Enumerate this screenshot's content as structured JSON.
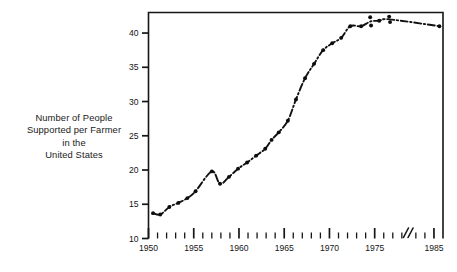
{
  "figure": {
    "axis_caption_lines": [
      "Number of People",
      "Supported per Farmer",
      "in the",
      "United States"
    ]
  },
  "chart_data": {
    "type": "line",
    "title": "",
    "subtitle": "",
    "xlabel": "",
    "ylabel": "Number of People Supported per Farmer in the United States",
    "xlim": [
      1950,
      1986
    ],
    "ylim": [
      10,
      43
    ],
    "grid": false,
    "legend": null,
    "axis_break": {
      "present": true,
      "between": [
        1978,
        1983
      ],
      "symbol": "double-slash"
    },
    "x_tick_labels": [
      "1950",
      "1955",
      "1960",
      "1965",
      "1970",
      "1975",
      "1985"
    ],
    "x_major_ticks": [
      1950,
      1955,
      1960,
      1965,
      1970,
      1975,
      1985
    ],
    "x_minor_tick_interval": 1,
    "y_tick_labels": [
      "10",
      "15",
      "20",
      "25",
      "30",
      "35",
      "40"
    ],
    "y_major_ticks": [
      10,
      15,
      20,
      25,
      30,
      35,
      40
    ],
    "line_style": "dash-dot",
    "marker": "filled-circle",
    "color": "#111111",
    "x": [
      1950.5,
      1951.3,
      1952.3,
      1953.3,
      1954.3,
      1955.2,
      1957.0,
      1957.9,
      1958.9,
      1959.9,
      1960.9,
      1961.9,
      1962.9,
      1963.6,
      1964.4,
      1965.4,
      1966.3,
      1967.3,
      1968.3,
      1969.3,
      1970.3,
      1971.3,
      1972.3,
      1973.5,
      1974.5,
      1974.6,
      1975.5,
      1976.6,
      1976.7,
      1985.6
    ],
    "y": [
      13.7,
      13.5,
      14.6,
      15.2,
      15.9,
      16.9,
      19.8,
      18.0,
      19.0,
      20.2,
      21.1,
      22.1,
      23.1,
      24.4,
      25.5,
      27.2,
      30.3,
      33.4,
      35.5,
      37.5,
      38.5,
      39.3,
      41.0,
      41.0,
      42.3,
      41.1,
      41.8,
      42.4,
      41.6,
      41.0
    ],
    "series": [
      {
        "name": "People supported per farmer",
        "points": [
          {
            "year": 1950.5,
            "value": 13.7
          },
          {
            "year": 1951.3,
            "value": 13.5
          },
          {
            "year": 1952.3,
            "value": 14.6
          },
          {
            "year": 1953.3,
            "value": 15.2
          },
          {
            "year": 1954.3,
            "value": 15.9
          },
          {
            "year": 1955.2,
            "value": 16.9
          },
          {
            "year": 1957.0,
            "value": 19.8
          },
          {
            "year": 1957.9,
            "value": 18.0
          },
          {
            "year": 1958.9,
            "value": 19.0
          },
          {
            "year": 1959.9,
            "value": 20.2
          },
          {
            "year": 1960.9,
            "value": 21.1
          },
          {
            "year": 1961.9,
            "value": 22.1
          },
          {
            "year": 1962.9,
            "value": 23.1
          },
          {
            "year": 1963.6,
            "value": 24.4
          },
          {
            "year": 1964.4,
            "value": 25.5
          },
          {
            "year": 1965.4,
            "value": 27.2
          },
          {
            "year": 1966.3,
            "value": 30.3
          },
          {
            "year": 1967.3,
            "value": 33.4
          },
          {
            "year": 1968.3,
            "value": 35.5
          },
          {
            "year": 1969.3,
            "value": 37.5
          },
          {
            "year": 1970.3,
            "value": 38.5
          },
          {
            "year": 1971.3,
            "value": 39.3
          },
          {
            "year": 1972.3,
            "value": 41.0
          },
          {
            "year": 1973.5,
            "value": 41.0
          },
          {
            "year": 1974.5,
            "value": 42.3
          },
          {
            "year": 1974.6,
            "value": 41.1
          },
          {
            "year": 1975.5,
            "value": 41.8
          },
          {
            "year": 1976.6,
            "value": 42.4
          },
          {
            "year": 1976.7,
            "value": 41.6
          },
          {
            "year": 1985.6,
            "value": 41.0
          }
        ]
      }
    ]
  }
}
